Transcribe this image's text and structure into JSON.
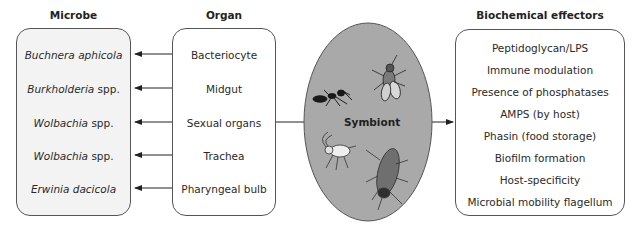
{
  "microbe": {
    "title": "Microbe",
    "items": [
      {
        "italic": "Buchnera aphicola",
        "plain": ""
      },
      {
        "italic": "Burkholderia",
        "plain": " spp."
      },
      {
        "italic": "Wolbachia",
        "plain": " spp."
      },
      {
        "italic": "Wolbachia",
        "plain": " spp."
      },
      {
        "italic": "Erwinia dacicola",
        "plain": ""
      }
    ]
  },
  "organ": {
    "title": "Organ",
    "items": [
      "Bacteriocyte",
      "Midgut",
      "Sexual organs",
      "Trachea",
      "Pharyngeal bulb"
    ]
  },
  "symbiont": {
    "label": "Symbiont",
    "icons": [
      "ant-icon",
      "fly-icon",
      "aphid-icon",
      "cockroach-icon"
    ],
    "fill_color": "#a9a9a9"
  },
  "effectors": {
    "title": "Biochemical effectors",
    "items": [
      "Peptidoglycan/LPS",
      "Immune modulation",
      "Presence of phosphatases",
      "AMPS (by host)",
      "Phasin (food storage)",
      "Biofilm formation",
      "Host-specificity",
      "Microbial mobility flagellum"
    ]
  }
}
